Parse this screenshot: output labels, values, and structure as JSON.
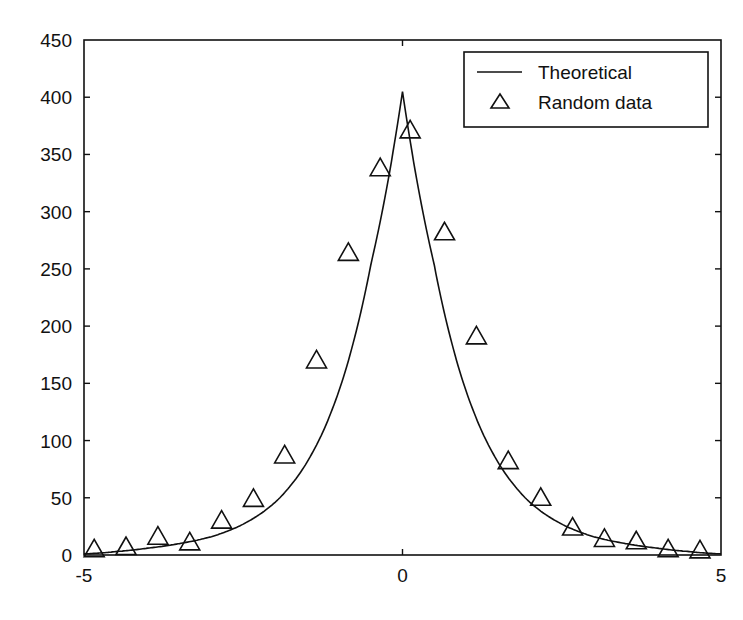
{
  "chart_data": {
    "type": "line",
    "title": "",
    "xlabel": "",
    "ylabel": "",
    "xlim": [
      -5,
      5
    ],
    "ylim": [
      0,
      450
    ],
    "grid": false,
    "legend_position": "upper right",
    "x_ticks": [
      "-5",
      "0",
      "5"
    ],
    "y_ticks": [
      "0",
      "50",
      "100",
      "150",
      "200",
      "250",
      "300",
      "350",
      "400",
      "450"
    ],
    "legend": [
      "Theoretical",
      "Random data"
    ],
    "series": [
      {
        "name": "Theoretical",
        "style": "line",
        "x": [
          -5,
          -4.5,
          -4,
          -3.5,
          -3,
          -2.5,
          -2,
          -1.5,
          -1,
          -0.5,
          0,
          0.5,
          1,
          1.5,
          2,
          2.5,
          3,
          3.5,
          4,
          4.5,
          5
        ],
        "values": [
          1,
          3,
          6,
          10,
          16,
          27,
          46,
          81,
          143,
          253,
          405,
          253,
          143,
          81,
          46,
          27,
          16,
          10,
          6,
          3,
          1
        ]
      },
      {
        "name": "Random data",
        "style": "triangle-markers",
        "x": [
          -4.84,
          -4.34,
          -3.84,
          -3.34,
          -2.84,
          -2.34,
          -1.85,
          -1.35,
          -0.85,
          -0.35,
          0.12,
          0.66,
          1.16,
          1.66,
          2.17,
          2.67,
          3.17,
          3.67,
          4.17,
          4.67
        ],
        "values": [
          5,
          7,
          16,
          11,
          30,
          49,
          87,
          170,
          264,
          338,
          371,
          282,
          191,
          82,
          50,
          24,
          14,
          12,
          5,
          4
        ]
      }
    ]
  }
}
